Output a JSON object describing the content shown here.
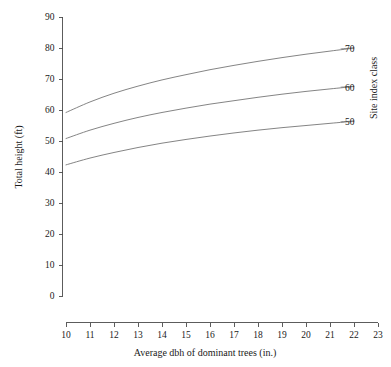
{
  "chart_data": {
    "type": "line",
    "title": "",
    "xlabel": "Average dbh of dominant trees (in.)",
    "ylabel": "Total height (ft)",
    "legend_title": "Site index class",
    "legend_position": "right-outside",
    "grid": false,
    "xlim": [
      10,
      23
    ],
    "ylim": [
      0,
      90
    ],
    "xticks": [
      10,
      11,
      12,
      13,
      14,
      15,
      16,
      17,
      18,
      19,
      20,
      21,
      22,
      23
    ],
    "yticks": [
      0,
      10,
      20,
      30,
      40,
      50,
      60,
      70,
      80,
      90
    ],
    "xtick_labels": [
      "10",
      "11",
      "12",
      "13",
      "14",
      "15",
      "16",
      "17",
      "18",
      "19",
      "20",
      "21",
      "22",
      "23"
    ],
    "ytick_labels": [
      "0",
      "10",
      "20",
      "30",
      "40",
      "50",
      "60",
      "70",
      "80",
      "90"
    ],
    "x": [
      10,
      11,
      12,
      13,
      14,
      15,
      16,
      17,
      18,
      19,
      20,
      21,
      22
    ],
    "series": [
      {
        "name": "70",
        "label": "70",
        "values": [
          59.2,
          62.6,
          65.4,
          67.7,
          69.7,
          71.4,
          73.0,
          74.4,
          75.7,
          76.9,
          78.0,
          79.0,
          80.0
        ]
      },
      {
        "name": "60",
        "label": "60",
        "values": [
          50.8,
          53.5,
          55.7,
          57.6,
          59.2,
          60.6,
          61.9,
          63.0,
          64.1,
          65.1,
          66.0,
          66.8,
          67.6
        ]
      },
      {
        "name": "50",
        "label": "50",
        "values": [
          42.3,
          44.5,
          46.3,
          47.9,
          49.3,
          50.5,
          51.6,
          52.6,
          53.5,
          54.3,
          55.0,
          55.7,
          56.4
        ]
      }
    ]
  }
}
